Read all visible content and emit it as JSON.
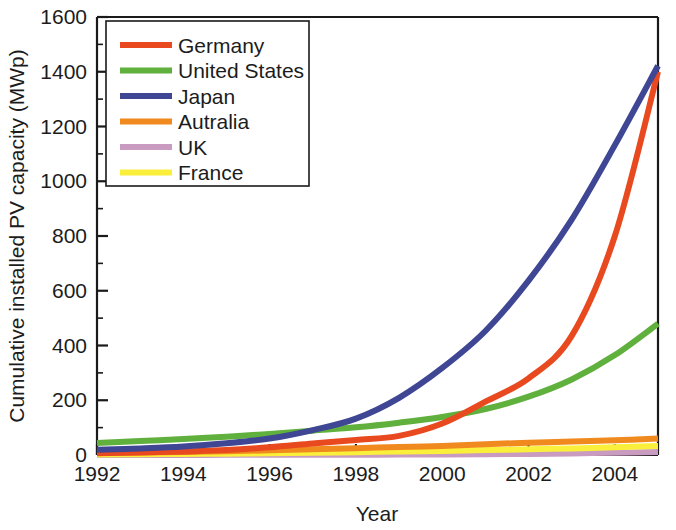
{
  "chart_data": {
    "type": "line",
    "title": "",
    "xlabel": "Year",
    "ylabel": "Cumulative installed PV capacity (MWp)",
    "xlim": [
      1992,
      2005
    ],
    "ylim": [
      0,
      1600
    ],
    "xticks": [
      1992,
      1994,
      1996,
      1998,
      2000,
      2002,
      2004
    ],
    "xtick_labels": [
      "1992",
      "1994",
      "1996",
      "1998",
      "2000",
      "2002",
      "2004"
    ],
    "xminor_ticks": [
      1993,
      1995,
      1997,
      1999,
      2001,
      2003,
      2005
    ],
    "yticks": [
      0,
      200,
      400,
      600,
      800,
      1000,
      1200,
      1400,
      1600
    ],
    "ytick_labels": [
      "0",
      "200",
      "400",
      "600",
      "800",
      "1000",
      "1200",
      "1400",
      "1600"
    ],
    "yminor_ticks": [
      100,
      300,
      500,
      700,
      900,
      1100,
      1300,
      1500
    ],
    "grid": false,
    "legend_position": "upper left",
    "x": [
      1992,
      1993,
      1994,
      1995,
      1996,
      1997,
      1998,
      1999,
      2000,
      2001,
      2002,
      2003,
      2004,
      2005
    ],
    "series": [
      {
        "name": "Germany",
        "color": "#E8491E",
        "values": [
          6,
          9,
          13,
          18,
          28,
          42,
          55,
          70,
          115,
          195,
          280,
          435,
          800,
          1400
        ]
      },
      {
        "name": "United States",
        "color": "#5FB03C",
        "values": [
          44,
          51,
          58,
          67,
          77,
          89,
          101,
          118,
          139,
          168,
          213,
          276,
          365,
          480
        ]
      },
      {
        "name": "Japan",
        "color": "#3F4694",
        "values": [
          19,
          24,
          31,
          43,
          60,
          91,
          133,
          209,
          318,
          453,
          637,
          860,
          1132,
          1422
        ]
      },
      {
        "name": "Autralia",
        "color": "#F08A1E",
        "values": [
          7,
          9,
          11,
          14,
          17,
          21,
          25,
          29,
          33,
          39,
          45,
          49,
          54,
          60
        ]
      },
      {
        "name": "UK",
        "color": "#C99BC0",
        "values": [
          0.2,
          0.3,
          0.4,
          0.5,
          0.6,
          0.7,
          1.0,
          1.4,
          1.9,
          2.7,
          4.1,
          5.9,
          8.2,
          11
        ]
      },
      {
        "name": "France",
        "color": "#FAF03C",
        "values": [
          2,
          3,
          4,
          5,
          6,
          8,
          10,
          13,
          15,
          18,
          21,
          24,
          28,
          33
        ]
      }
    ]
  },
  "legend": {
    "entries": [
      {
        "label": "Germany",
        "color": "#E8491E"
      },
      {
        "label": "United States",
        "color": "#5FB03C"
      },
      {
        "label": "Japan",
        "color": "#3F4694"
      },
      {
        "label": "Autralia",
        "color": "#F08A1E"
      },
      {
        "label": "UK",
        "color": "#C99BC0"
      },
      {
        "label": "France",
        "color": "#FAF03C"
      }
    ]
  },
  "axes": {
    "x_title": "Year",
    "y_title": "Cumulative installed PV capacity (MWp)"
  }
}
